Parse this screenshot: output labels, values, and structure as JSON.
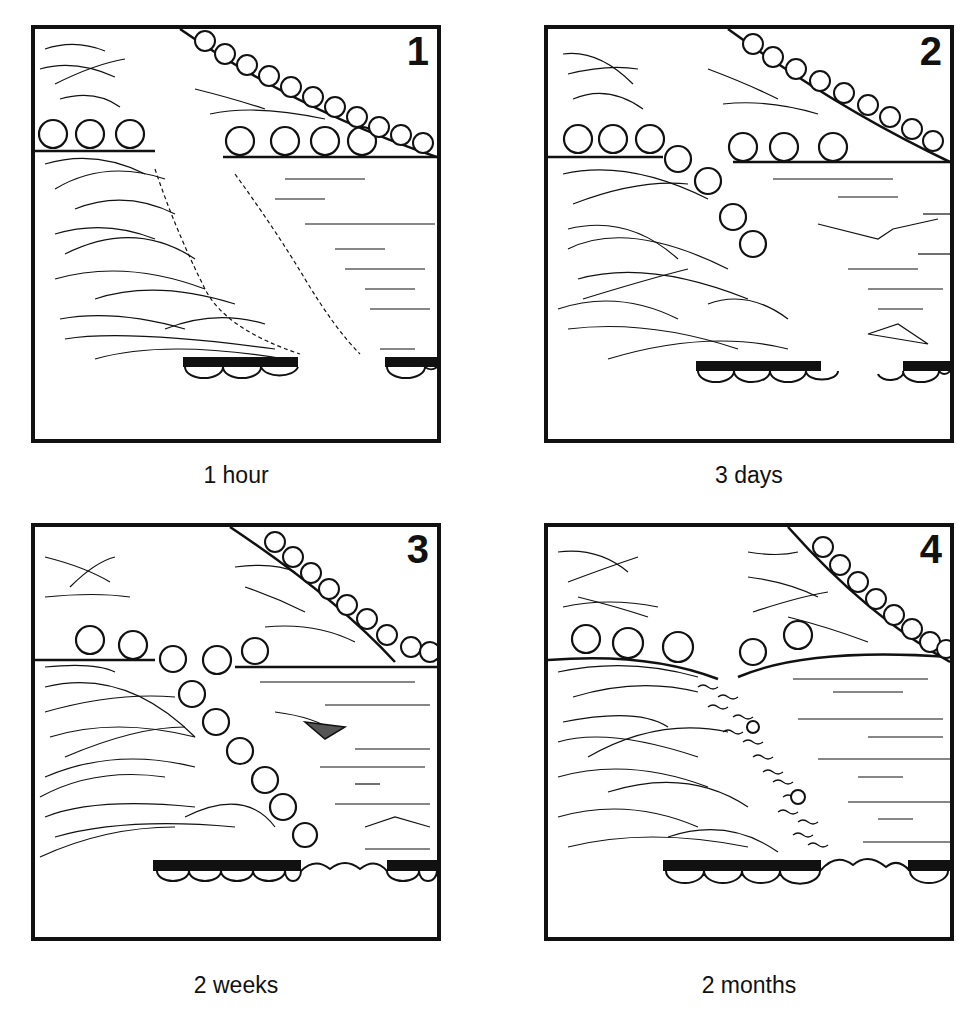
{
  "figure": {
    "panels": [
      {
        "number": "1",
        "caption": "1 hour"
      },
      {
        "number": "2",
        "caption": "3 days"
      },
      {
        "number": "3",
        "caption": "2 weeks"
      },
      {
        "number": "4",
        "caption": "2 months"
      }
    ]
  },
  "colors": {
    "ink": "#111111",
    "background": "#ffffff"
  }
}
